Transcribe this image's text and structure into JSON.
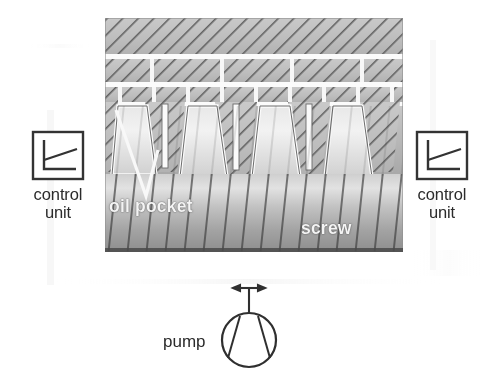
{
  "figure": {
    "background_color": "#ffffff",
    "ink_color": "#2b2b2b",
    "label_color_on_dark": "#f4f4f4"
  },
  "controls": {
    "left": {
      "label_line1": "control",
      "label_line2": "unit",
      "icon": "graph-axes-rising-line-icon",
      "box": {
        "x": 33,
        "y": 132,
        "w": 50,
        "h": 47
      }
    },
    "right": {
      "label_line1": "control",
      "label_line2": "unit",
      "icon": "graph-axes-rising-line-icon",
      "box": {
        "x": 417,
        "y": 132,
        "w": 50,
        "h": 47
      }
    }
  },
  "pump": {
    "label": "pump",
    "icon": "pump-circle-triangle-icon",
    "arrow_icon": "double-headed-arrow-icon",
    "circle": {
      "cx": 249,
      "cy": 340,
      "r": 27
    },
    "label_position": {
      "x": 163,
      "y": 332
    }
  },
  "assembly": {
    "region": {
      "x": 105,
      "y": 18,
      "w": 298,
      "h": 234
    },
    "nut_section": {
      "name": "nut",
      "hatch": "diagonal-hatch",
      "bands": [
        {
          "y": 18,
          "h": 36
        },
        {
          "y": 58,
          "h": 24
        },
        {
          "y": 86,
          "h": 16
        }
      ]
    },
    "screw_section": {
      "name": "screw",
      "teeth_count": 4,
      "thread_form": "trapezoidal",
      "oil_film": "white-outline-gap"
    },
    "annotations": [
      {
        "id": "oil-pocket",
        "text": "oil pocket",
        "leader": "white-v-leader-line"
      },
      {
        "id": "screw",
        "text": "screw",
        "leader": "none"
      }
    ]
  }
}
